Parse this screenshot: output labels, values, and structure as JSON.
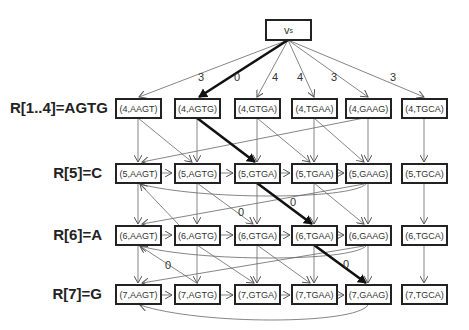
{
  "source_node": {
    "label": "v",
    "subscript": "s"
  },
  "rows": [
    {
      "label": "R[1..4]=AGTG",
      "nodes": [
        "(4,AAGT)",
        "(4,AGTG)",
        "(4,GTGA)",
        "(4,TGAA)",
        "(4,GAAG)",
        "(4,TGCA)"
      ]
    },
    {
      "label": "R[5]=C",
      "nodes": [
        "(5,AAGT)",
        "(5,AGTG)",
        "(5,GTGA)",
        "(5,TGAA)",
        "(5,GAAG)",
        "(5,TGCA)"
      ]
    },
    {
      "label": "R[6]=A",
      "nodes": [
        "(6,AAGT)",
        "(6,AGTG)",
        "(6,GTGA)",
        "(6,TGAA)",
        "(6,GAAG)",
        "(6,TGCA)"
      ]
    },
    {
      "label": "R[7]=G",
      "nodes": [
        "(7,AAGT)",
        "(7,AGTG)",
        "(7,GTGA)",
        "(7,TGAA)",
        "(7,GAAG)",
        "(7,TGCA)"
      ]
    }
  ],
  "source_edge_weights": [
    "3",
    "0",
    "4",
    "4",
    "3",
    "3"
  ],
  "inner_edge_weights": [
    "0",
    "0",
    "0",
    "0"
  ],
  "colors": {
    "edge": "#555555",
    "highlight_path": "#111111",
    "box_border": "#222222"
  }
}
